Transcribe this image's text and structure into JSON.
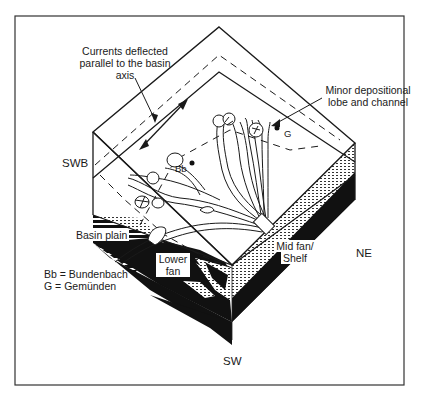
{
  "diagram": {
    "type": "block-diagram",
    "labels": {
      "currents": [
        "Currents deflected",
        "parallel to the basin",
        "axis"
      ],
      "minor_lobe": [
        "Minor depositional",
        "lobe and channel"
      ],
      "swb": "SWB",
      "ne": "NE",
      "sw": "SW",
      "bb_marker": "Bb",
      "g_marker": "G",
      "basin_plain": "Basin plain",
      "lower_fan": [
        "Lower",
        "fan"
      ],
      "mid_fan": [
        "Mid fan/",
        "Shelf"
      ]
    },
    "legend": [
      {
        "abbr": "Bb",
        "text": "Bb = Bundenbach"
      },
      {
        "abbr": "G",
        "text": "G = Gemünden"
      }
    ],
    "colors": {
      "line": "#1a1a1a",
      "fill_dark": "#111111",
      "background": "#ffffff"
    }
  }
}
